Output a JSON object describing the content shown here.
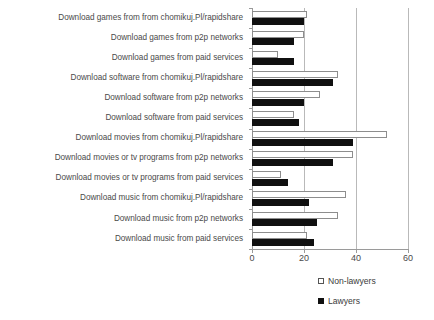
{
  "chart_data": {
    "type": "bar",
    "orientation": "horizontal",
    "title": "",
    "xlabel": "",
    "ylabel": "",
    "xlim": [
      0,
      60
    ],
    "xticks": [
      0,
      20,
      40,
      60
    ],
    "grid": true,
    "legend_position": "bottom-right",
    "categories": [
      "Download games from from chomikuj.Pl/rapidshare",
      "Download games from p2p networks",
      "Download games from paid services",
      "Download software from chomikuj.Pl/rapidshare",
      "Download software from p2p networks",
      "Download software from paid services",
      "Download movies from chomikuj.Pl/rapidshare",
      "Download movies or tv programs from p2p networks",
      "Download movies or tv programs from paid services",
      "Download music from chomikuj.Pl/rapidshare",
      "Download music from p2p networks",
      "Download music from paid services"
    ],
    "series": [
      {
        "name": "Non-lawyers",
        "color": "#ffffff",
        "border_color": "#8d8d8d",
        "values": [
          21,
          20,
          10,
          33,
          26,
          16,
          52,
          39,
          11,
          36,
          33,
          21
        ]
      },
      {
        "name": "Lawyers",
        "color": "#101010",
        "border_color": "#101010",
        "values": [
          20,
          16,
          16,
          31,
          20,
          18,
          39,
          31,
          14,
          22,
          25,
          24
        ]
      }
    ]
  },
  "legend": {
    "items": [
      {
        "label": "Non-lawyers",
        "swatch": "open-square"
      },
      {
        "label": "Lawyers",
        "swatch": "solid-square"
      }
    ]
  },
  "axis": {
    "x_tick_labels": [
      "0",
      "20",
      "40",
      "60"
    ]
  }
}
